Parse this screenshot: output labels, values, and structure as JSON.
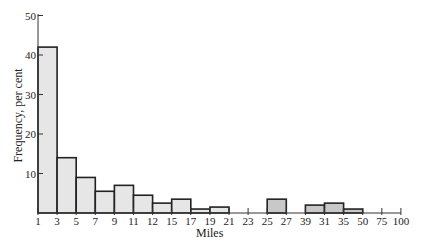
{
  "chart_data": {
    "type": "bar",
    "title": "",
    "xlabel": "Miles",
    "ylabel": "Frequency, per cent",
    "ylim": [
      0,
      50
    ],
    "yticks": [
      10,
      20,
      30,
      40,
      50
    ],
    "xtick_labels": [
      "1",
      "3",
      "5",
      "7",
      "9",
      "11",
      "12",
      "15",
      "17",
      "19",
      "21",
      "23",
      "25",
      "27",
      "39",
      "31",
      "35",
      "50",
      "75",
      "100"
    ],
    "grid": false,
    "legend": null,
    "categories": [
      "1-3",
      "3-5",
      "5-7",
      "7-9",
      "9-11",
      "11-12",
      "12-15",
      "15-17",
      "17-19",
      "19-21",
      "21-23",
      "23-25",
      "25-27",
      "27-39",
      "39-31",
      "31-35",
      "35-50",
      "50-75",
      "75-100"
    ],
    "values": [
      42,
      14,
      9,
      5.5,
      7,
      4.5,
      2.5,
      3.5,
      1,
      1.5,
      0,
      0,
      3.5,
      0,
      2,
      2.5,
      1,
      0,
      0
    ],
    "highlighted_bins": [
      "25-27",
      "39-31",
      "31-35",
      "35-50"
    ]
  },
  "axis": {
    "x_label": "Miles",
    "y_label": "Frequency, per cent"
  }
}
